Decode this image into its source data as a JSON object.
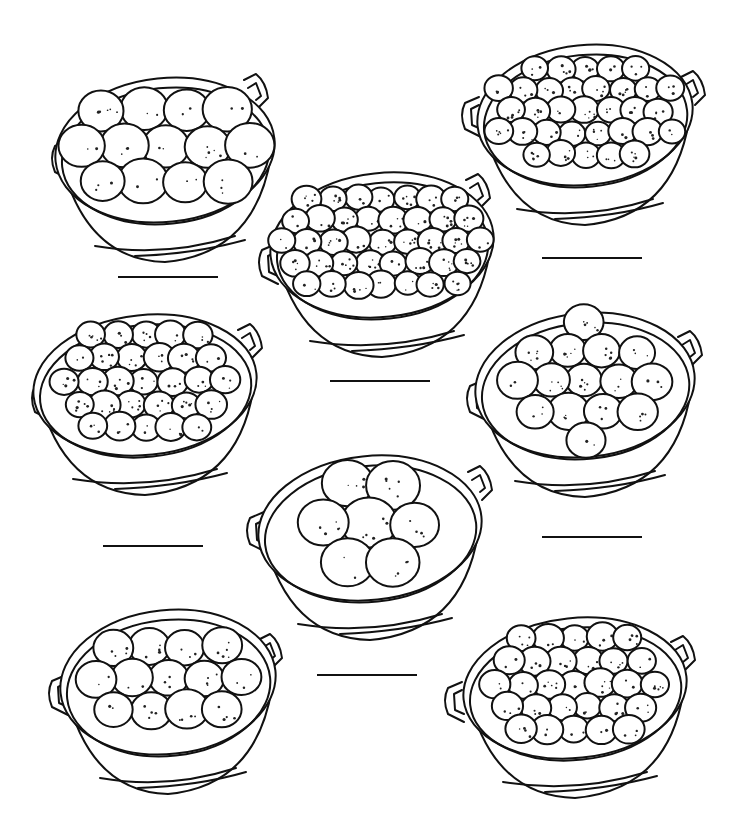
{
  "worksheet": {
    "title": "",
    "background": "#ffffff",
    "ink_color": "#111111",
    "task": "count-oranges-in-each-bowl",
    "bowls": [
      {
        "id": "bowl-1",
        "cx": 165,
        "cy": 150,
        "rx": 110,
        "ry": 72,
        "handle_left": [
          55,
          158
        ],
        "handle_right": [
          258,
          88
        ],
        "orange_count": 16,
        "orange_r": 22,
        "answer_line": {
          "x1": 118,
          "x2": 218,
          "y": 277,
          "value": ""
        }
      },
      {
        "id": "bowl-2",
        "cx": 585,
        "cy": 115,
        "rx": 108,
        "ry": 70,
        "handle_left": [
          465,
          115
        ],
        "handle_right": [
          695,
          85
        ],
        "orange_count": 36,
        "orange_r": 13,
        "answer_line": {
          "x1": 542,
          "x2": 642,
          "y": 258,
          "value": ""
        }
      },
      {
        "id": "bowl-3",
        "cx": 382,
        "cy": 245,
        "rx": 112,
        "ry": 72,
        "handle_left": [
          262,
          262
        ],
        "handle_right": [
          480,
          188
        ],
        "orange_count": 45,
        "orange_r": 13,
        "answer_line": {
          "x1": 330,
          "x2": 430,
          "y": 381,
          "value": ""
        }
      },
      {
        "id": "bowl-4",
        "cx": 145,
        "cy": 385,
        "rx": 112,
        "ry": 70,
        "handle_left": [
          35,
          398
        ],
        "handle_right": [
          252,
          338
        ],
        "orange_count": 33,
        "orange_r": 14,
        "answer_line": {
          "x1": 103,
          "x2": 203,
          "y": 546,
          "value": ""
        }
      },
      {
        "id": "bowl-5",
        "cx": 585,
        "cy": 385,
        "rx": 110,
        "ry": 72,
        "handle_left": [
          470,
          398
        ],
        "handle_right": [
          692,
          345
        ],
        "orange_count": 21,
        "orange_r": 18,
        "answer_line": {
          "x1": 542,
          "x2": 642,
          "y": 537,
          "value": ""
        }
      },
      {
        "id": "bowl-6",
        "cx": 370,
        "cy": 528,
        "rx": 112,
        "ry": 72,
        "handle_left": [
          250,
          530
        ],
        "handle_right": [
          482,
          480
        ],
        "orange_count": 9,
        "orange_r": 24,
        "answer_line": null
      },
      {
        "id": "bowl-7",
        "cx": 168,
        "cy": 682,
        "rx": 108,
        "ry": 72,
        "handle_left": [
          52,
          693
        ],
        "handle_right": [
          272,
          648
        ],
        "orange_count": 20,
        "orange_r": 19,
        "answer_line": {
          "x1": 317,
          "x2": 417,
          "y": 675,
          "value": ""
        }
      },
      {
        "id": "bowl-8",
        "cx": 575,
        "cy": 688,
        "rx": 112,
        "ry": 70,
        "handle_left": [
          448,
          700
        ],
        "handle_right": [
          685,
          650
        ],
        "orange_count": 34,
        "orange_r": 14,
        "answer_line": null
      }
    ]
  }
}
